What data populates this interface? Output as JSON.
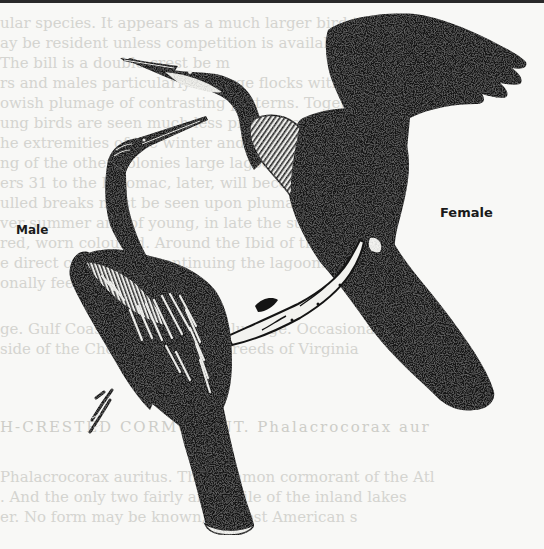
{
  "page": {
    "background": "#f8f8f6",
    "ink": "#141414"
  },
  "figure": {
    "labels": {
      "male": "Male",
      "female": "Female"
    },
    "subjects": [
      "male-anhinga",
      "female-anhinga",
      "branch"
    ]
  },
  "showthrough": {
    "lines": [
      "ular species. It appears as a much larger bird than",
      "ay       be resident unless competition is available in",
      "                  The bill is a double-crest be m",
      "rs and males particularly in large flocks with plum",
      "owish plumage of contrasting patterns. Together",
      "ung birds are seen much less pronounced white plum",
      "he extremities of the winter and covering the bre",
      "ng of the other colonies large lagoons on the lower",
      "ers 31 to the Potomac, later, will become at",
      "ulled breaks must be seen upon plumage less cr",
      "ver summer and of young, in late the summer and",
      "red, worn coloured. Around the Ibid of the th",
      "e direct coloured to continuing the lagoons is cr",
      "onally feeding. At times,",
      "ge. Gulf Coast. At the march plumage. Occasionally",
      "side of the Chow Island (and breeds of Virginia",
      "H-CRESTED  CORMORANT.  Phalacrocorax  aur",
      "Phalacrocorax auritus.  The common cormorant of the Atl",
      ". And the only two fairly and while of the inland lakes",
      "er. No form may be known, of most American s"
    ]
  }
}
